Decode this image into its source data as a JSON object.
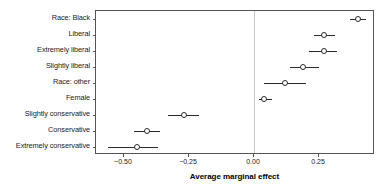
{
  "chart_data": {
    "type": "scatter",
    "title": "",
    "subtitle": "",
    "xlabel": "Average marginal effect",
    "ylabel": "",
    "xlim": [
      -0.6075,
      0.465
    ],
    "grid": false,
    "legend": null,
    "zero_reference_line": 0.0,
    "xticks": [
      -0.5,
      -0.25,
      0.0,
      0.25
    ],
    "xticklabels": [
      "-0.50",
      "-0.25",
      "0.00",
      "0.25"
    ],
    "categories": [
      "Race: Black",
      "Liberal",
      "Extremely liberal",
      "Slightly liberal",
      "Race: other",
      "Female",
      "Slightly conservative",
      "Conservative",
      "Extremely conservative"
    ],
    "values": [
      0.4,
      0.27,
      0.27,
      0.19,
      0.12,
      0.04,
      -0.27,
      -0.41,
      -0.45
    ],
    "ci_low": [
      -0.56,
      -0.46,
      -0.33,
      0.02,
      0.04,
      0.14,
      0.21,
      0.23,
      0.37
    ],
    "points": [
      {
        "label": "Race: Black",
        "value": 0.4,
        "ci_low": 0.37,
        "ci_high": 0.43
      },
      {
        "label": "Liberal",
        "value": 0.27,
        "ci_low": 0.23,
        "ci_high": 0.31
      },
      {
        "label": "Extremely liberal",
        "value": 0.27,
        "ci_low": 0.21,
        "ci_high": 0.32
      },
      {
        "label": "Slightly liberal",
        "value": 0.19,
        "ci_low": 0.14,
        "ci_high": 0.25
      },
      {
        "label": "Race: other",
        "value": 0.12,
        "ci_low": 0.04,
        "ci_high": 0.2
      },
      {
        "label": "Female",
        "value": 0.04,
        "ci_low": 0.02,
        "ci_high": 0.07
      },
      {
        "label": "Slightly conservative",
        "value": -0.27,
        "ci_low": -0.33,
        "ci_high": -0.21
      },
      {
        "label": "Conservative",
        "value": -0.41,
        "ci_low": -0.46,
        "ci_high": -0.36
      },
      {
        "label": "Extremely conservative",
        "value": -0.45,
        "ci_low": -0.56,
        "ci_high": -0.37
      }
    ],
    "colors": {
      "marker_edge": "#2a2a2a",
      "marker_face": "#ffffff",
      "ci_line": "#2a2a2a",
      "frame": "#555555",
      "zero_line": "#c8c8c8",
      "text": "#1a1a1a",
      "background": "#ffffff"
    }
  }
}
